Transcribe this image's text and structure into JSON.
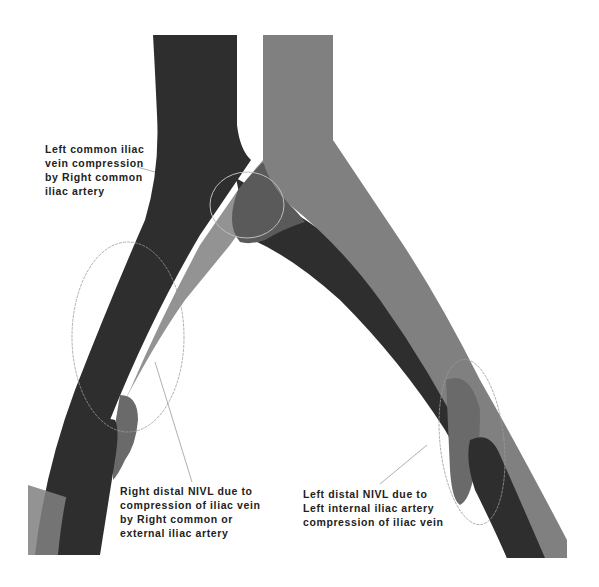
{
  "diagram": {
    "colors": {
      "vein": "#2e2e2e",
      "artery": "#7f7f7f",
      "overlap": "#5c5c5c",
      "annotation_line": "#9a9a9a",
      "background": "#ffffff",
      "text": "#222222"
    },
    "vessels": [
      {
        "name": "Inferior vena cava / iliac veins",
        "shade": "dark"
      },
      {
        "name": "Aorta / iliac arteries",
        "shade": "gray"
      }
    ],
    "annotations": [
      {
        "id": "left-common",
        "lines": [
          "Left common iliac",
          "vein compression",
          "by Right common",
          "iliac artery"
        ]
      },
      {
        "id": "right-distal",
        "lines": [
          "Right distal NIVL due to",
          "compression of iliac vein",
          "by Right common or",
          "external iliac artery"
        ]
      },
      {
        "id": "left-distal",
        "lines": [
          "Left distal NIVL due to",
          "Left internal iliac artery",
          "compression of iliac vein"
        ]
      }
    ]
  }
}
